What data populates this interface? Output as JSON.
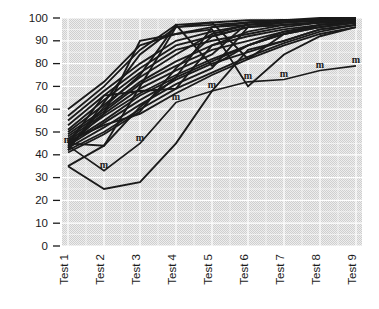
{
  "chart_data": {
    "type": "line",
    "title": "",
    "subtitle": "",
    "xlabel": "",
    "ylabel": "",
    "categories": [
      "Test 1",
      "Test 2",
      "Test 3",
      "Test 4",
      "Test 5",
      "Test 6",
      "Test 7",
      "Test 8",
      "Test 9"
    ],
    "x_tick_labels": [
      "Test 1",
      "Test 2",
      "Test 3",
      "Test 4",
      "Test 5",
      "Test 6",
      "Test 7",
      "Test 8",
      "Test 9"
    ],
    "y_tick_labels": [
      "0",
      "10",
      "20",
      "30",
      "40",
      "50",
      "60",
      "70",
      "80",
      "90",
      "100"
    ],
    "y_ticks": [
      0,
      10,
      20,
      30,
      40,
      50,
      60,
      70,
      80,
      90,
      100
    ],
    "ylim": [
      0,
      100
    ],
    "xlim": [
      1,
      9
    ],
    "grid": true,
    "grid_color": "#ffffff",
    "plot_background": "#e2e2e2",
    "line_color": "#1a1a1a",
    "legend": "none",
    "legend_position": "none",
    "annotations": [],
    "marker_glyph": "m",
    "series": [
      {
        "name": "Subject 1",
        "marker": "none",
        "values": [
          60,
          72,
          88,
          93,
          96,
          98,
          99,
          99,
          100
        ]
      },
      {
        "name": "Subject 2",
        "marker": "none",
        "values": [
          57,
          70,
          86,
          97,
          98,
          99,
          99,
          100,
          100
        ]
      },
      {
        "name": "Subject 3",
        "marker": "none",
        "values": [
          55,
          68,
          80,
          90,
          94,
          97,
          98,
          99,
          99
        ]
      },
      {
        "name": "Subject 4",
        "marker": "none",
        "values": [
          53,
          66,
          78,
          88,
          92,
          96,
          97,
          98,
          99
        ]
      },
      {
        "name": "Subject 5",
        "marker": "none",
        "values": [
          51,
          64,
          76,
          86,
          90,
          93,
          96,
          98,
          99
        ]
      },
      {
        "name": "Subject 6",
        "marker": "none",
        "values": [
          50,
          62,
          74,
          84,
          93,
          97,
          99,
          99,
          100
        ]
      },
      {
        "name": "Subject 7",
        "marker": "none",
        "values": [
          49,
          60,
          72,
          81,
          88,
          92,
          95,
          97,
          98
        ]
      },
      {
        "name": "Subject 8",
        "marker": "none",
        "values": [
          48,
          59,
          71,
          79,
          86,
          90,
          94,
          96,
          98
        ]
      },
      {
        "name": "Subject 9",
        "marker": "none",
        "values": [
          47,
          58,
          69,
          77,
          84,
          98,
          99,
          99,
          100
        ]
      },
      {
        "name": "Subject 10",
        "marker": "none",
        "values": [
          46,
          57,
          67,
          75,
          82,
          88,
          93,
          96,
          98
        ]
      },
      {
        "name": "Subject 11",
        "marker": "none",
        "values": [
          45,
          55,
          66,
          74,
          96,
          97,
          98,
          99,
          99
        ]
      },
      {
        "name": "Subject 12",
        "marker": "none",
        "values": [
          45,
          66,
          68,
          69,
          88,
          94,
          97,
          98,
          99
        ]
      },
      {
        "name": "Subject 13",
        "marker": "none",
        "values": [
          44,
          54,
          64,
          73,
          80,
          85,
          90,
          95,
          97
        ]
      },
      {
        "name": "Subject 14",
        "marker": "none",
        "values": [
          44,
          58,
          90,
          93,
          95,
          70,
          84,
          92,
          96
        ]
      },
      {
        "name": "Subject 15",
        "marker": "none",
        "values": [
          43,
          52,
          62,
          71,
          78,
          96,
          97,
          98,
          99
        ]
      },
      {
        "name": "Subject 16",
        "marker": "none",
        "values": [
          43,
          61,
          75,
          97,
          79,
          88,
          94,
          97,
          99
        ]
      },
      {
        "name": "Subject 17",
        "marker": "none",
        "values": [
          42,
          50,
          60,
          69,
          76,
          83,
          89,
          94,
          97
        ]
      },
      {
        "name": "Subject 18",
        "marker": "none",
        "values": [
          42,
          63,
          84,
          96,
          98,
          82,
          93,
          97,
          99
        ]
      },
      {
        "name": "Subject 19",
        "marker": "none",
        "values": [
          41,
          49,
          59,
          78,
          92,
          96,
          98,
          99,
          100
        ]
      },
      {
        "name": "Subject 20",
        "marker": "none",
        "values": [
          46,
          53,
          58,
          67,
          75,
          82,
          88,
          93,
          96
        ]
      },
      {
        "name": "Subject 21",
        "marker": "none",
        "values": [
          45,
          44,
          70,
          96,
          97,
          98,
          99,
          99,
          100
        ]
      },
      {
        "name": "Subject 22",
        "marker": "none",
        "values": [
          35,
          44,
          61,
          74,
          81,
          88,
          93,
          96,
          98
        ]
      },
      {
        "name": "Low performer A",
        "marker": "none",
        "values": [
          35,
          25,
          28,
          45,
          68,
          86,
          90,
          95,
          97
        ]
      },
      {
        "name": "Marked subject",
        "marker": "m",
        "values": [
          44,
          33,
          45,
          63,
          68,
          72,
          73,
          77,
          79
        ]
      }
    ]
  }
}
